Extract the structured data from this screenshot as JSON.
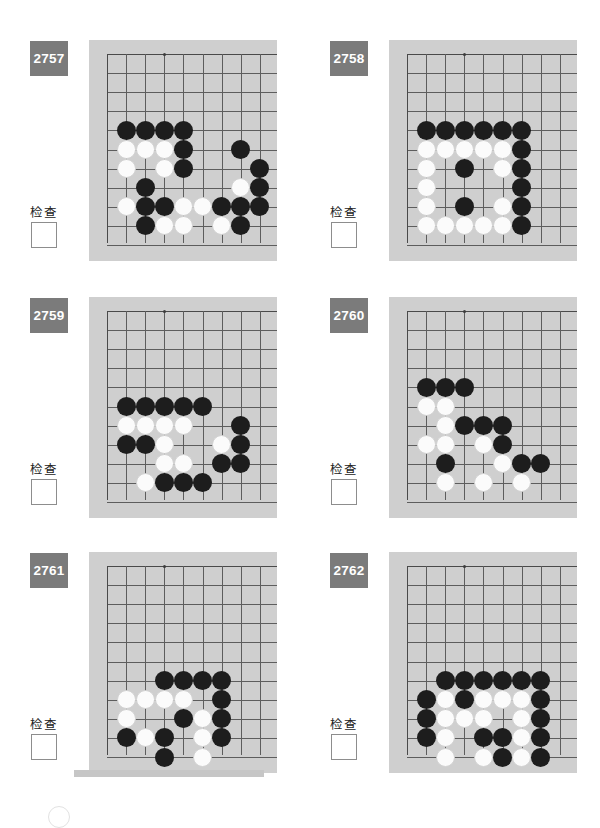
{
  "page": {
    "width": 600,
    "height": 818,
    "background": "#ffffff",
    "board_background": "#cfcfcf",
    "badge_color": "#7b7b7b",
    "grid_color": "#5d5d5d",
    "black_stone_color": "#1d1d1d",
    "white_stone_color": "#fbfbfb"
  },
  "common": {
    "check_label": "检查",
    "checkbox_value": "",
    "grid_cols": 10,
    "grid_rows": 10
  },
  "problems": [
    {
      "id": "2757",
      "number": "2757",
      "check_label": "检查",
      "stones": {
        "black": [
          [
            1,
            5
          ],
          [
            2,
            5
          ],
          [
            3,
            5
          ],
          [
            4,
            5
          ],
          [
            4,
            6
          ],
          [
            4,
            7
          ],
          [
            2,
            8
          ],
          [
            2,
            9
          ],
          [
            3,
            9
          ],
          [
            6,
            9
          ],
          [
            7,
            9
          ],
          [
            7,
            6
          ],
          [
            8,
            7
          ],
          [
            8,
            8
          ],
          [
            8,
            9
          ],
          [
            7,
            10
          ],
          [
            2,
            10
          ]
        ],
        "white": [
          [
            1,
            6
          ],
          [
            2,
            6
          ],
          [
            3,
            6
          ],
          [
            1,
            7
          ],
          [
            3,
            7
          ],
          [
            1,
            9
          ],
          [
            4,
            9
          ],
          [
            5,
            9
          ],
          [
            3,
            10
          ],
          [
            4,
            10
          ],
          [
            6,
            10
          ],
          [
            7,
            8
          ]
        ]
      }
    },
    {
      "id": "2758",
      "number": "2758",
      "check_label": "检查",
      "stones": {
        "black": [
          [
            1,
            5
          ],
          [
            2,
            5
          ],
          [
            3,
            5
          ],
          [
            4,
            5
          ],
          [
            5,
            5
          ],
          [
            6,
            5
          ],
          [
            6,
            6
          ],
          [
            6,
            7
          ],
          [
            6,
            8
          ],
          [
            6,
            9
          ],
          [
            6,
            10
          ],
          [
            3,
            7
          ],
          [
            3,
            9
          ]
        ],
        "white": [
          [
            1,
            6
          ],
          [
            2,
            6
          ],
          [
            3,
            6
          ],
          [
            4,
            6
          ],
          [
            5,
            6
          ],
          [
            1,
            7
          ],
          [
            5,
            7
          ],
          [
            1,
            8
          ],
          [
            1,
            9
          ],
          [
            5,
            9
          ],
          [
            1,
            10
          ],
          [
            2,
            10
          ],
          [
            3,
            10
          ],
          [
            4,
            10
          ],
          [
            5,
            10
          ]
        ]
      }
    },
    {
      "id": "2759",
      "number": "2759",
      "check_label": "检查",
      "stones": {
        "black": [
          [
            1,
            6
          ],
          [
            2,
            6
          ],
          [
            3,
            6
          ],
          [
            4,
            6
          ],
          [
            5,
            6
          ],
          [
            7,
            7
          ],
          [
            1,
            8
          ],
          [
            2,
            8
          ],
          [
            7,
            8
          ],
          [
            6,
            9
          ],
          [
            7,
            9
          ],
          [
            3,
            10
          ],
          [
            4,
            10
          ],
          [
            5,
            10
          ]
        ],
        "white": [
          [
            1,
            7
          ],
          [
            2,
            7
          ],
          [
            3,
            7
          ],
          [
            4,
            7
          ],
          [
            3,
            8
          ],
          [
            6,
            8
          ],
          [
            3,
            9
          ],
          [
            4,
            9
          ],
          [
            2,
            10
          ]
        ]
      }
    },
    {
      "id": "2760",
      "number": "2760",
      "check_label": "检查",
      "stones": {
        "black": [
          [
            1,
            5
          ],
          [
            2,
            5
          ],
          [
            3,
            5
          ],
          [
            3,
            7
          ],
          [
            4,
            7
          ],
          [
            5,
            7
          ],
          [
            5,
            8
          ],
          [
            2,
            9
          ],
          [
            6,
            9
          ],
          [
            7,
            9
          ]
        ],
        "white": [
          [
            1,
            6
          ],
          [
            2,
            6
          ],
          [
            2,
            7
          ],
          [
            1,
            8
          ],
          [
            2,
            8
          ],
          [
            4,
            8
          ],
          [
            5,
            9
          ],
          [
            2,
            10
          ],
          [
            4,
            10
          ],
          [
            6,
            10
          ]
        ]
      }
    },
    {
      "id": "2761",
      "number": "2761",
      "check_label": "检查",
      "stones": {
        "black": [
          [
            3,
            7
          ],
          [
            4,
            7
          ],
          [
            5,
            7
          ],
          [
            6,
            7
          ],
          [
            6,
            8
          ],
          [
            4,
            9
          ],
          [
            6,
            9
          ],
          [
            1,
            10
          ],
          [
            3,
            10
          ],
          [
            6,
            10
          ],
          [
            3,
            11
          ]
        ],
        "white": [
          [
            1,
            8
          ],
          [
            2,
            8
          ],
          [
            3,
            8
          ],
          [
            4,
            8
          ],
          [
            1,
            9
          ],
          [
            5,
            9
          ],
          [
            2,
            10
          ],
          [
            5,
            10
          ],
          [
            5,
            11
          ]
        ]
      }
    },
    {
      "id": "2762",
      "number": "2762",
      "check_label": "检查",
      "stones": {
        "black": [
          [
            2,
            7
          ],
          [
            3,
            7
          ],
          [
            4,
            7
          ],
          [
            5,
            7
          ],
          [
            6,
            7
          ],
          [
            7,
            7
          ],
          [
            1,
            8
          ],
          [
            3,
            8
          ],
          [
            7,
            8
          ],
          [
            1,
            9
          ],
          [
            7,
            9
          ],
          [
            1,
            10
          ],
          [
            4,
            10
          ],
          [
            5,
            10
          ],
          [
            7,
            10
          ],
          [
            5,
            11
          ],
          [
            7,
            11
          ]
        ],
        "white": [
          [
            2,
            8
          ],
          [
            4,
            8
          ],
          [
            5,
            8
          ],
          [
            6,
            8
          ],
          [
            2,
            9
          ],
          [
            3,
            9
          ],
          [
            4,
            9
          ],
          [
            6,
            9
          ],
          [
            2,
            10
          ],
          [
            6,
            10
          ],
          [
            2,
            11
          ],
          [
            4,
            11
          ],
          [
            6,
            11
          ]
        ]
      }
    }
  ]
}
